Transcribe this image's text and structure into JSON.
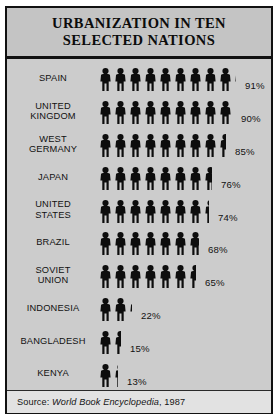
{
  "title": {
    "line1": "URBANIZATION IN TEN",
    "line2": "SELECTED NATIONS"
  },
  "source": {
    "prefix": "Source:",
    "work": "World Book Encyclopedia",
    "year": ", 1987"
  },
  "chart_data": {
    "type": "bar",
    "subtype": "pictogram",
    "title": "URBANIZATION IN TEN SELECTED NATIONS",
    "xlabel": "",
    "ylabel": "",
    "unit": "percent of population living in urban areas",
    "symbol": "human-figure",
    "symbol_value": 10,
    "value_suffix": "%",
    "xlim": [
      0,
      100
    ],
    "grid": false,
    "legend": false,
    "source": "World Book Encyclopedia, 1987",
    "categories": [
      "SPAIN",
      "UNITED KINGDOM",
      "WEST GERMANY",
      "JAPAN",
      "UNITED STATES",
      "BRAZIL",
      "SOVIET UNION",
      "INDONESIA",
      "BANGLADESH",
      "KENYA"
    ],
    "values": [
      91,
      90,
      85,
      76,
      74,
      68,
      65,
      22,
      15,
      13
    ],
    "labels": [
      "91%",
      "90%",
      "85%",
      "76%",
      "74%",
      "68%",
      "65%",
      "22%",
      "15%",
      "13%"
    ]
  },
  "rows": [
    {
      "name_line1": "SPAIN",
      "name_line2": "",
      "value": 91,
      "label": "91%"
    },
    {
      "name_line1": "UNITED",
      "name_line2": "KINGDOM",
      "value": 90,
      "label": "90%"
    },
    {
      "name_line1": "WEST",
      "name_line2": "GERMANY",
      "value": 85,
      "label": "85%"
    },
    {
      "name_line1": "JAPAN",
      "name_line2": "",
      "value": 76,
      "label": "76%"
    },
    {
      "name_line1": "UNITED",
      "name_line2": "STATES",
      "value": 74,
      "label": "74%"
    },
    {
      "name_line1": "BRAZIL",
      "name_line2": "",
      "value": 68,
      "label": "68%"
    },
    {
      "name_line1": "SOVIET",
      "name_line2": "UNION",
      "value": 65,
      "label": "65%"
    },
    {
      "name_line1": "INDONESIA",
      "name_line2": "",
      "value": 22,
      "label": "22%"
    },
    {
      "name_line1": "BANGLADESH",
      "name_line2": "",
      "value": 15,
      "label": "15%"
    },
    {
      "name_line1": "KENYA",
      "name_line2": "",
      "value": 13,
      "label": "13%"
    }
  ],
  "colors": {
    "figure": "#0d0d0d",
    "panel": "#cccccc",
    "title_band": "#c4c4c4",
    "source_band": "#e2e2e2",
    "border": "#111111",
    "text": "#111111"
  }
}
